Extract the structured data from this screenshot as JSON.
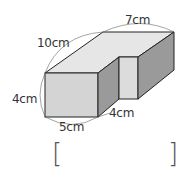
{
  "figure": {
    "type": "l-shaped prism solid",
    "labels": {
      "depth": "10cm",
      "back_width": "7cm",
      "height": "4cm",
      "front_width": "5cm",
      "notch_depth": "4cm"
    },
    "colors": {
      "top_face": "#e6e6e6",
      "front_face": "#d4d4d4",
      "side_face": "#9a9a9a",
      "edge": "#222222"
    }
  },
  "answer_box": {
    "left_bracket": "[",
    "right_bracket": "]",
    "value": ""
  }
}
